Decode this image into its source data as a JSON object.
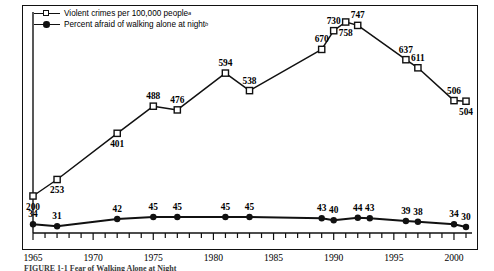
{
  "legend": {
    "series1": {
      "label": "Violent crimes per 100,000 people",
      "sup": "a",
      "marker": "open-square"
    },
    "series2": {
      "label": "Percent afraid of walking alone at night",
      "sup": "b",
      "marker": "filled-circle"
    }
  },
  "caption": "FIGURE 1-1   Fear of Walking Alone at Night",
  "chart_data": {
    "type": "line",
    "title": "",
    "xlabel": "",
    "ylabel": "",
    "xlim": [
      1965,
      2001
    ],
    "xticks_every": 1,
    "xtick_labels": [
      "1965",
      "1970",
      "1975",
      "1980",
      "1985",
      "1990",
      "1995",
      "2000"
    ],
    "xtick_label_values": [
      1965,
      1970,
      1975,
      1980,
      1985,
      1990,
      1995,
      2000
    ],
    "grid": false,
    "legend_position": "top-left",
    "series": [
      {
        "name": "Violent crimes per 100,000 people",
        "marker": "open-square",
        "x": [
          1965,
          1967,
          1972,
          1975,
          1977,
          1981,
          1983,
          1989,
          1990,
          1991,
          1992,
          1996,
          1997,
          2000,
          2001
        ],
        "values": [
          200,
          253,
          401,
          488,
          476,
          594,
          538,
          670,
          730,
          758,
          747,
          637,
          611,
          506,
          504
        ],
        "label_pos": [
          "below",
          "below",
          "below",
          "above",
          "above",
          "above",
          "above",
          "above",
          "above",
          "below",
          "above",
          "above",
          "above",
          "above",
          "below"
        ]
      },
      {
        "name": "Percent afraid of walking alone at night",
        "marker": "filled-circle",
        "x": [
          1965,
          1967,
          1972,
          1975,
          1977,
          1981,
          1983,
          1989,
          1990,
          1992,
          1993,
          1996,
          1997,
          2000,
          2001
        ],
        "values": [
          34,
          31,
          42,
          45,
          45,
          45,
          45,
          43,
          40,
          44,
          43,
          39,
          38,
          34,
          30
        ],
        "label_pos": [
          "above",
          "above",
          "above",
          "above",
          "above",
          "above",
          "above",
          "above",
          "above",
          "above",
          "above",
          "above",
          "above",
          "above",
          "above"
        ]
      }
    ]
  },
  "colors": {
    "ink": "#111111",
    "background": "#ffffff"
  }
}
